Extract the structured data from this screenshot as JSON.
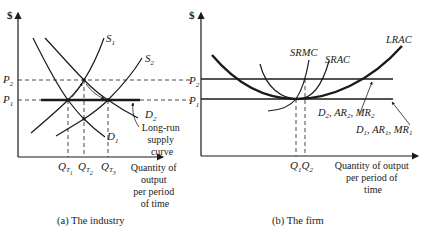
{
  "panels": [
    {
      "id": "industry",
      "caption": "(a) The industry",
      "y_axis_label": "$",
      "x_axis_label_lines": [
        "Quantity of",
        "output",
        "per period",
        "of time"
      ],
      "price_labels": {
        "p2": "P",
        "p2_sub": "2",
        "p1": "P",
        "p1_sub": "1"
      },
      "curves": {
        "s1": {
          "main": "S",
          "sub": "1"
        },
        "s2": {
          "main": "S",
          "sub": "2"
        },
        "d1": {
          "main": "D",
          "sub": "1"
        },
        "d2": {
          "main": "D",
          "sub": "2"
        },
        "lrs_lines": [
          "Long-run",
          "supply",
          "curve"
        ]
      },
      "quantity_labels": [
        {
          "main": "Q",
          "sub1": "T",
          "sub2": "1"
        },
        {
          "main": "Q",
          "sub1": "T",
          "sub2": "2"
        },
        {
          "main": "Q",
          "sub1": "T",
          "sub2": "3"
        }
      ]
    },
    {
      "id": "firm",
      "caption": "(b) The firm",
      "y_axis_label": "$",
      "x_axis_label_lines": [
        "Quantity of output",
        "per period of",
        "time"
      ],
      "price_labels": {
        "p2": "P",
        "p2_sub": "2",
        "p1": "P",
        "p1_sub": "1"
      },
      "curves": {
        "lrac": "LRAC",
        "srmc": "SRMC",
        "srac": "SRAC",
        "d2_line": [
          {
            "main": "D",
            "sub": "2"
          },
          {
            "main": "AR",
            "sub": "2"
          },
          {
            "main": "MR",
            "sub": "2"
          }
        ],
        "d1_line": [
          {
            "main": "D",
            "sub": "1"
          },
          {
            "main": "AR",
            "sub": "1"
          },
          {
            "main": "MR",
            "sub": "1"
          }
        ]
      },
      "quantity_labels": [
        {
          "main": "Q",
          "sub": "1"
        },
        {
          "main": "Q",
          "sub": "2"
        }
      ]
    }
  ],
  "colors": {
    "ink": "#1a1a1a",
    "background": "#ffffff"
  }
}
